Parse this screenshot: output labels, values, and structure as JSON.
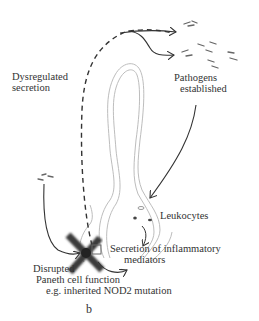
{
  "figure": {
    "panel_label": "b",
    "labels": {
      "dysregulated_secretion": [
        "Dysregulated",
        "secretion"
      ],
      "pathogens": [
        "Pathogens",
        "established"
      ],
      "leukocytes": "Leukocytes",
      "secretion_mediators": [
        "Secretion of inflammatory",
        "mediators"
      ],
      "disrupted": "Disrupted",
      "paneth": [
        "Paneth cell function",
        "e.g. inherited NOD2 mutation"
      ]
    },
    "colors": {
      "ink": "#2a2a2a",
      "crypt_outline": "#b8b8b8",
      "cross": "#3a3a3a"
    }
  }
}
